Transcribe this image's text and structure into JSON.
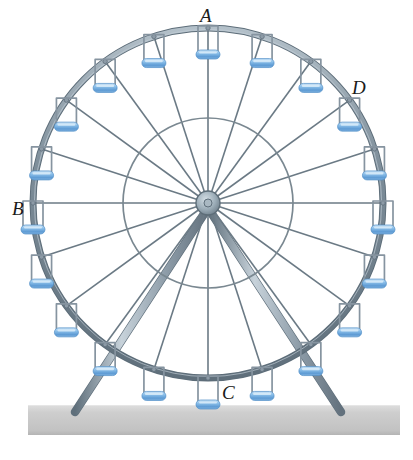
{
  "figure": {
    "kind": "ferris-wheel-diagram",
    "background_color": "#ffffff",
    "width": 413,
    "height": 460
  },
  "labels": [
    {
      "id": "A",
      "text": "A",
      "position": "top-of-wheel",
      "x": 200,
      "y": 6
    },
    {
      "id": "B",
      "text": "B",
      "position": "left-of-wheel",
      "x": 12,
      "y": 199
    },
    {
      "id": "C",
      "text": "C",
      "position": "bottom-of-wheel",
      "x": 222,
      "y": 383
    },
    {
      "id": "D",
      "text": "D",
      "position": "upper-right-outside-rim",
      "x": 352,
      "y": 78
    }
  ],
  "geometry": {
    "center_x": 208,
    "center_y": 203,
    "outer_radius": 175,
    "inner_radius": 85,
    "hub_radius": 12,
    "hub_bore_radius": 4,
    "cabin_count": 20,
    "spoke_count": 20,
    "cabin_angle_step_deg": 18,
    "cabin_frame_width": 20,
    "cabin_frame_height": 24,
    "seat_width": 24,
    "seat_height": 9,
    "legs": [
      {
        "name": "left-leg",
        "top_x": 208,
        "top_y": 208,
        "bottom_x": 75,
        "bottom_y": 412,
        "width": 7
      },
      {
        "name": "right-leg",
        "top_x": 208,
        "top_y": 208,
        "bottom_x": 341,
        "bottom_y": 412,
        "width": 7
      }
    ],
    "ground": {
      "x": 28,
      "y": 405,
      "width": 372,
      "height": 30
    }
  },
  "colors": {
    "rim": "#6e7f8d",
    "rim_highlight": "#aebcc6",
    "spoke": "#6b7a85",
    "inner_circle": "#7a8891",
    "hub_fill": "#9fb0ba",
    "hub_stroke": "#5d6d78",
    "cabin_frame": "#8694a0",
    "seat_light": "#bcdcf4",
    "seat_mid": "#7bb4e2",
    "seat_dark": "#4a8bc7",
    "leg": "#8e9daa",
    "leg_highlight": "#c3cdd6",
    "ground_top": "#d8d8d8",
    "ground_body": "#c9c9c9",
    "ground_bottom": "#bdbdbd",
    "label_text": "#1a1a1a"
  }
}
